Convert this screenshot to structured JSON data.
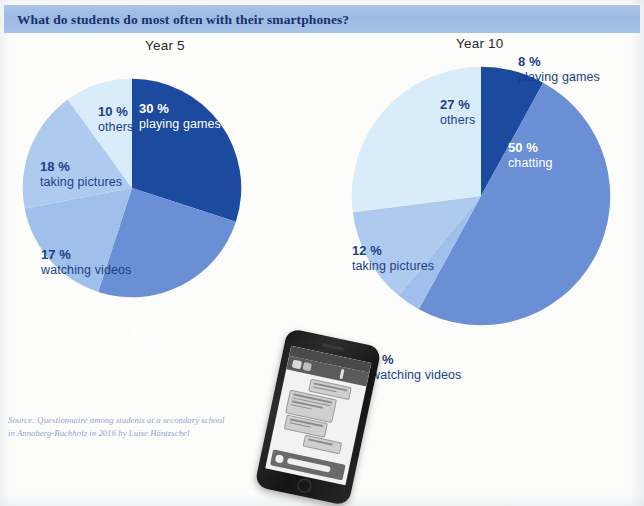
{
  "header": {
    "title": "What do students do most often with their smartphones?",
    "banner_color": "#a3bfe6",
    "text_color": "#16306e"
  },
  "source": {
    "line1": "Source: Questionnaire among students at a secondary school",
    "line2": "in Annaberg-Buchholz in 2016 by Luise Häntzschel"
  },
  "colors": {
    "playing_games": "#1c4a9e",
    "chatting": "#6b8fd4",
    "watching_videos": "#9fc0ea",
    "taking_pictures": "#aecaee",
    "others": "#d8ecf9",
    "label_blue": "#2b5298",
    "label_white": "#ffffff"
  },
  "chart_data": [
    {
      "type": "pie",
      "title": "Year 5",
      "categories": [
        "playing games",
        "chatting",
        "watching videos",
        "taking pictures",
        "others"
      ],
      "values": [
        30,
        25,
        17,
        18,
        10
      ],
      "labels": [
        "30 %",
        "25 %",
        "17 %",
        "18 %",
        "10 %"
      ],
      "colors": [
        "#1c4a9e",
        "#6b8fd4",
        "#9fc0ea",
        "#aecaee",
        "#d8ecf9"
      ],
      "unit": "%",
      "legend": "none",
      "label_placement": [
        "inside",
        "inside",
        "outside",
        "outside",
        "inside"
      ]
    },
    {
      "type": "pie",
      "title": "Year 10",
      "categories": [
        "playing games",
        "chatting",
        "watching videos",
        "taking pictures",
        "others"
      ],
      "values": [
        8,
        50,
        3,
        12,
        27
      ],
      "labels": [
        "8 %",
        "50 %",
        "3 %",
        "12 %",
        "27 %"
      ],
      "colors": [
        "#1c4a9e",
        "#6b8fd4",
        "#9fc0ea",
        "#aecaee",
        "#d8ecf9"
      ],
      "unit": "%",
      "legend": "none",
      "label_placement": [
        "outside",
        "inside",
        "outside",
        "outside",
        "inside"
      ]
    }
  ],
  "year5": {
    "title": "Year 5",
    "playing_games": {
      "pct": "30 %",
      "desc": "playing games"
    },
    "chatting": {
      "pct": "25 %",
      "desc": "chatting"
    },
    "watching_videos": {
      "pct": "17 %",
      "desc": "watching videos"
    },
    "taking_pictures": {
      "pct": "18 %",
      "desc": "taking pictures"
    },
    "others": {
      "pct": "10 %",
      "desc": "others"
    }
  },
  "year10": {
    "title": "Year 10",
    "playing_games": {
      "pct": "8 %",
      "desc": "playing games"
    },
    "chatting": {
      "pct": "50 %",
      "desc": "chatting"
    },
    "watching_videos": {
      "pct": "3 %",
      "desc": "watching videos"
    },
    "taking_pictures": {
      "pct": "12 %",
      "desc": "taking pictures"
    },
    "others": {
      "pct": "27 %",
      "desc": "others"
    }
  },
  "photo": {
    "name": "smartphone-photo",
    "caption": ""
  }
}
